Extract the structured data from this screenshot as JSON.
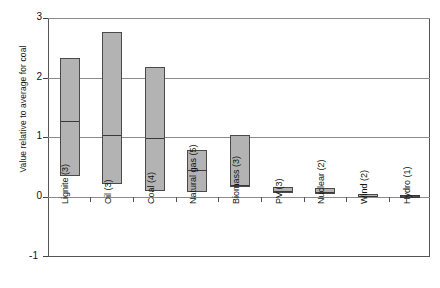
{
  "chart_data": {
    "type": "bar",
    "title": "",
    "xlabel": "",
    "ylabel": "Value relative to average for coal",
    "ylim": [
      -1,
      3
    ],
    "yticks": [
      3,
      2,
      1,
      0,
      -1
    ],
    "ytick_labels": [
      "3",
      "2",
      "1",
      "0",
      "-1"
    ],
    "grid": true,
    "gridlines_at": [
      3,
      2,
      1,
      0
    ],
    "legend": "none",
    "notation": "Each bar is a floating box spanning min to max, with an internal line marking the central/median value. Number in parentheses after each category name is the count of studies.",
    "categories": [
      "Lignite (3)",
      "Oil (3)",
      "Coal (4)",
      "Natural gas (5)",
      "Biomass (3)",
      "PV (3)",
      "Nuclear (2)",
      "Wind (2)",
      "Hydro (1)"
    ],
    "series": [
      {
        "name": "low",
        "values": [
          0.35,
          0.22,
          0.11,
          0.08,
          0.17,
          0.07,
          0.06,
          0.02,
          0.01
        ]
      },
      {
        "name": "median",
        "values": [
          1.29,
          1.06,
          1.0,
          0.48,
          0.22,
          0.12,
          0.1,
          0.04,
          0.02
        ]
      },
      {
        "name": "high",
        "values": [
          2.33,
          2.77,
          2.18,
          0.79,
          1.05,
          0.17,
          0.15,
          0.06,
          0.03
        ]
      }
    ],
    "points": [
      {
        "category": "Lignite (3)",
        "low": 0.35,
        "median": 1.29,
        "high": 2.33,
        "n": 3
      },
      {
        "category": "Oil (3)",
        "low": 0.22,
        "median": 1.06,
        "high": 2.77,
        "n": 3
      },
      {
        "category": "Coal (4)",
        "low": 0.11,
        "median": 1.0,
        "high": 2.18,
        "n": 4
      },
      {
        "category": "Natural gas (5)",
        "low": 0.08,
        "median": 0.48,
        "high": 0.79,
        "n": 5
      },
      {
        "category": "Biomass (3)",
        "low": 0.17,
        "median": 0.22,
        "high": 1.05,
        "n": 3
      },
      {
        "category": "PV (3)",
        "low": 0.07,
        "median": 0.12,
        "high": 0.17,
        "n": 3
      },
      {
        "category": "Nuclear (2)",
        "low": 0.06,
        "median": 0.1,
        "high": 0.15,
        "n": 2
      },
      {
        "category": "Wind (2)",
        "low": 0.02,
        "median": 0.04,
        "high": 0.06,
        "n": 2
      },
      {
        "category": "Hydro (1)",
        "low": 0.01,
        "median": 0.02,
        "high": 0.03,
        "n": 1
      }
    ],
    "colors": {
      "box_fill": "#b3b3b3",
      "box_edge": "#4a4a4a",
      "median_line": "#3a3a3a",
      "gridline": "#8b8b8b",
      "axis": "#555555",
      "text": "#131313",
      "background": "#ffffff"
    }
  },
  "axis": {
    "y_title": "Value relative to average for coal",
    "ticks": [
      "3",
      "2",
      "1",
      "0",
      "-1"
    ]
  },
  "labels": {
    "c0": "Lignite (3)",
    "c1": "Oil (3)",
    "c2": "Coal (4)",
    "c3": "Natural gas (5)",
    "c4": "Biomass (3)",
    "c5": "PV (3)",
    "c6": "Nuclear (2)",
    "c7": "Wind (2)",
    "c8": "Hydro (1)"
  }
}
